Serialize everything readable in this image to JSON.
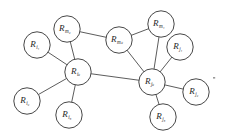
{
  "figure": {
    "node_radius": 13.2,
    "colors": {
      "edge": "#4a4a4a",
      "node_stroke": "#3d3d3d",
      "node_fill": "#ffffff",
      "label": "#262626",
      "background": "#ffffff"
    }
  },
  "nodes": [
    {
      "id": "R_i1",
      "base": "R",
      "sub": "i₁",
      "sub_plain": "i1",
      "x": 37,
      "y": 45,
      "label": "R i1"
    },
    {
      "id": "R_i2",
      "base": "R",
      "sub": "i₂",
      "sub_plain": "i2",
      "x": 27,
      "y": 101,
      "label": "R i2"
    },
    {
      "id": "R_i3",
      "base": "R",
      "sub": "i₃",
      "sub_plain": "i3",
      "x": 69,
      "y": 115,
      "label": "R i3"
    },
    {
      "id": "R_ik",
      "base": "R",
      "sub": "iₖ",
      "sub_plain": "ik",
      "x": 78,
      "y": 72,
      "label": "R ik"
    },
    {
      "id": "R_m2",
      "base": "R",
      "sub": "m₂",
      "sub_plain": "m2",
      "x": 67,
      "y": 29,
      "label": "R m2"
    },
    {
      "id": "R_mk",
      "base": "R",
      "sub": "mₖ",
      "sub_plain": "mk",
      "x": 119,
      "y": 40,
      "label": "R mk"
    },
    {
      "id": "R_m1",
      "base": "R",
      "sub": "m₁",
      "sub_plain": "m1",
      "x": 161,
      "y": 24,
      "label": "R m1"
    },
    {
      "id": "R_j1",
      "base": "R",
      "sub": "j₁",
      "sub_plain": "j1",
      "x": 180,
      "y": 47,
      "label": "R j1"
    },
    {
      "id": "R_jk",
      "base": "R",
      "sub": "jₖ",
      "sub_plain": "jk",
      "x": 152,
      "y": 82,
      "label": "R jk"
    },
    {
      "id": "R_j2",
      "base": "R",
      "sub": "j₂",
      "sub_plain": "j2",
      "x": 196,
      "y": 92,
      "label": "R j2"
    },
    {
      "id": "R_j3",
      "base": "R",
      "sub": "j₃",
      "sub_plain": "j3",
      "x": 163,
      "y": 117,
      "label": "R j3"
    }
  ],
  "edges": [
    {
      "from": "R_i1",
      "to": "R_ik"
    },
    {
      "from": "R_i2",
      "to": "R_ik"
    },
    {
      "from": "R_i3",
      "to": "R_ik"
    },
    {
      "from": "R_ik",
      "to": "R_jk"
    },
    {
      "from": "R_ik",
      "to": "R_m2"
    },
    {
      "from": "R_m2",
      "to": "R_mk"
    },
    {
      "from": "R_mk",
      "to": "R_m1"
    },
    {
      "from": "R_mk",
      "to": "R_jk"
    },
    {
      "from": "R_m1",
      "to": "R_jk"
    },
    {
      "from": "R_j1",
      "to": "R_jk"
    },
    {
      "from": "R_j2",
      "to": "R_jk"
    },
    {
      "from": "R_j3",
      "to": "R_jk"
    }
  ],
  "artifacts": [
    {
      "id": "speck-1",
      "x": 213,
      "y": 77,
      "w": 2.2,
      "h": 1.6
    }
  ]
}
